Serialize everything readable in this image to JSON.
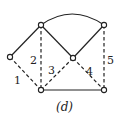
{
  "figure": {
    "caption": "(d)",
    "nodes": [
      {
        "id": "left",
        "x": 10,
        "y": 57
      },
      {
        "id": "top-left",
        "x": 41,
        "y": 25
      },
      {
        "id": "center",
        "x": 73,
        "y": 58
      },
      {
        "id": "top-right",
        "x": 104,
        "y": 25
      },
      {
        "id": "bottom-left",
        "x": 41,
        "y": 90
      },
      {
        "id": "bottom-right",
        "x": 104,
        "y": 90
      }
    ],
    "edges": [
      {
        "from": "left",
        "to": "top-left",
        "style": "solid",
        "label": ""
      },
      {
        "from": "left",
        "to": "bottom-left",
        "style": "dashed",
        "label": "1"
      },
      {
        "from": "top-left",
        "to": "bottom-left",
        "style": "dashed",
        "label": "2"
      },
      {
        "from": "center",
        "to": "bottom-left",
        "style": "dashed",
        "label": "3"
      },
      {
        "from": "center",
        "to": "bottom-right",
        "style": "dashed",
        "label": "4"
      },
      {
        "from": "top-right",
        "to": "bottom-right",
        "style": "dashed",
        "label": "5"
      },
      {
        "from": "top-left",
        "to": "center",
        "style": "solid",
        "label": ""
      },
      {
        "from": "center",
        "to": "top-right",
        "style": "solid",
        "label": ""
      },
      {
        "from": "top-left",
        "to": "top-right",
        "style": "arc",
        "label": ""
      },
      {
        "from": "bottom-left",
        "to": "bottom-right",
        "style": "solid",
        "label": ""
      }
    ],
    "labels": {
      "e1": "1",
      "e2": "2",
      "e3": "3",
      "e4": "4",
      "e5": "5"
    }
  }
}
